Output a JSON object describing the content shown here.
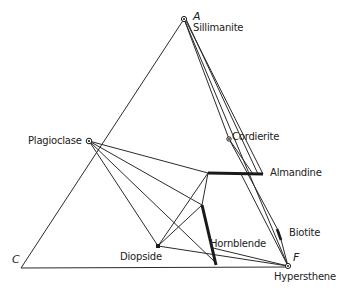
{
  "diagram": {
    "type": "ternary-phase-diagram",
    "vertices": {
      "A": {
        "letter": "A",
        "mineral": "Sillimanite"
      },
      "C": {
        "letter": "C"
      },
      "F": {
        "letter": "F",
        "mineral": "Hypersthene"
      }
    },
    "phases": {
      "plagioclase": "Plagioclase",
      "cordierite": "Cordierite",
      "almandine": "Almandine",
      "biotite": "Biotite",
      "hornblende": "Hornblende",
      "diopside": "Diopside"
    },
    "colors": {
      "line": "#2a2a2a",
      "text": "#222222",
      "background": "#ffffff"
    }
  }
}
